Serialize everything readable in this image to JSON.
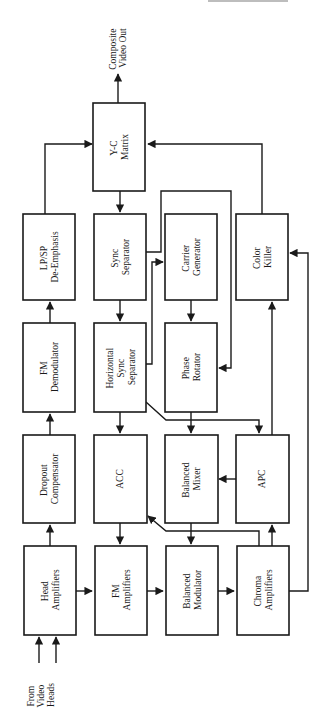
{
  "diagram": {
    "orientation": "rotated 90 degrees counter-clockwise",
    "colors": {
      "line": "#1a1a1a",
      "background": "#ffffff",
      "block_fill": "#ffffff"
    },
    "inputs": {
      "from_video_heads": [
        "From",
        "Video",
        "Heads"
      ]
    },
    "outputs": {
      "composite_video_out": [
        "Composite",
        "Video Out"
      ]
    },
    "blocks": {
      "yc_matrix": [
        "Y-C",
        "Matrix"
      ],
      "lpsp_de_emphasis": [
        "LP/SP",
        "De-Emphasis"
      ],
      "fm_demodulator": [
        "FM",
        "Demodulator"
      ],
      "dropout_compensator": [
        "Dropout",
        "Compensator"
      ],
      "head_amplifiers": [
        "Head",
        "Amplifiers"
      ],
      "sync_separator": [
        "Sync",
        "Separator"
      ],
      "horizontal_sync_separator": [
        "Horizontal",
        "Sync",
        "Separator"
      ],
      "acc": [
        "ACC"
      ],
      "fm_amplifiers": [
        "FM",
        "Amplifiers"
      ],
      "carrier_generator": [
        "Carrier",
        "Generator"
      ],
      "phase_rotator": [
        "Phase",
        "Rotator"
      ],
      "balanced_mixer": [
        "Balanced",
        "Mixer"
      ],
      "balanced_modulator": [
        "Balanced",
        "Modulator"
      ],
      "color_killer": [
        "Color",
        "Killer"
      ],
      "apc": [
        "APC"
      ],
      "chroma_amplifiers": [
        "Chroma",
        "Amplifiers"
      ]
    },
    "connections": [
      {
        "from": "From Video Heads",
        "to": "Head Amplifiers"
      },
      {
        "from": "Head Amplifiers",
        "to": "Dropout Compensator"
      },
      {
        "from": "Dropout Compensator",
        "to": "FM Demodulator"
      },
      {
        "from": "FM Demodulator",
        "to": "LP/SP De-Emphasis"
      },
      {
        "from": "LP/SP De-Emphasis",
        "to": "Y-C Matrix"
      },
      {
        "from": "Y-C Matrix",
        "to": "Composite Video Out"
      },
      {
        "from": "Y-C Matrix",
        "to": "Sync Separator"
      },
      {
        "from": "Sync Separator",
        "to": "Horizontal Sync Separator"
      },
      {
        "from": "Sync Separator",
        "to": "Phase Rotator"
      },
      {
        "from": "Horizontal Sync Separator",
        "to": "Carrier Generator"
      },
      {
        "from": "Horizontal Sync Separator",
        "to": "ACC"
      },
      {
        "from": "Horizontal Sync Separator",
        "to": "APC"
      },
      {
        "from": "Carrier Generator",
        "to": "Phase Rotator"
      },
      {
        "from": "Phase Rotator",
        "to": "Balanced Mixer"
      },
      {
        "from": "APC",
        "to": "Balanced Mixer"
      },
      {
        "from": "APC",
        "to": "Color Killer"
      },
      {
        "from": "Balanced Mixer",
        "to": "Balanced Modulator"
      },
      {
        "from": "ACC",
        "to": "FM Amplifiers"
      },
      {
        "from": "Head Amplifiers",
        "to": "FM Amplifiers"
      },
      {
        "from": "FM Amplifiers",
        "to": "Balanced Modulator"
      },
      {
        "from": "Balanced Modulator",
        "to": "Chroma Amplifiers"
      },
      {
        "from": "Chroma Amplifiers",
        "to": "ACC"
      },
      {
        "from": "Chroma Amplifiers",
        "to": "APC"
      },
      {
        "from": "Chroma Amplifiers",
        "to": "Color Killer"
      },
      {
        "from": "Color Killer",
        "to": "Y-C Matrix"
      }
    ]
  }
}
